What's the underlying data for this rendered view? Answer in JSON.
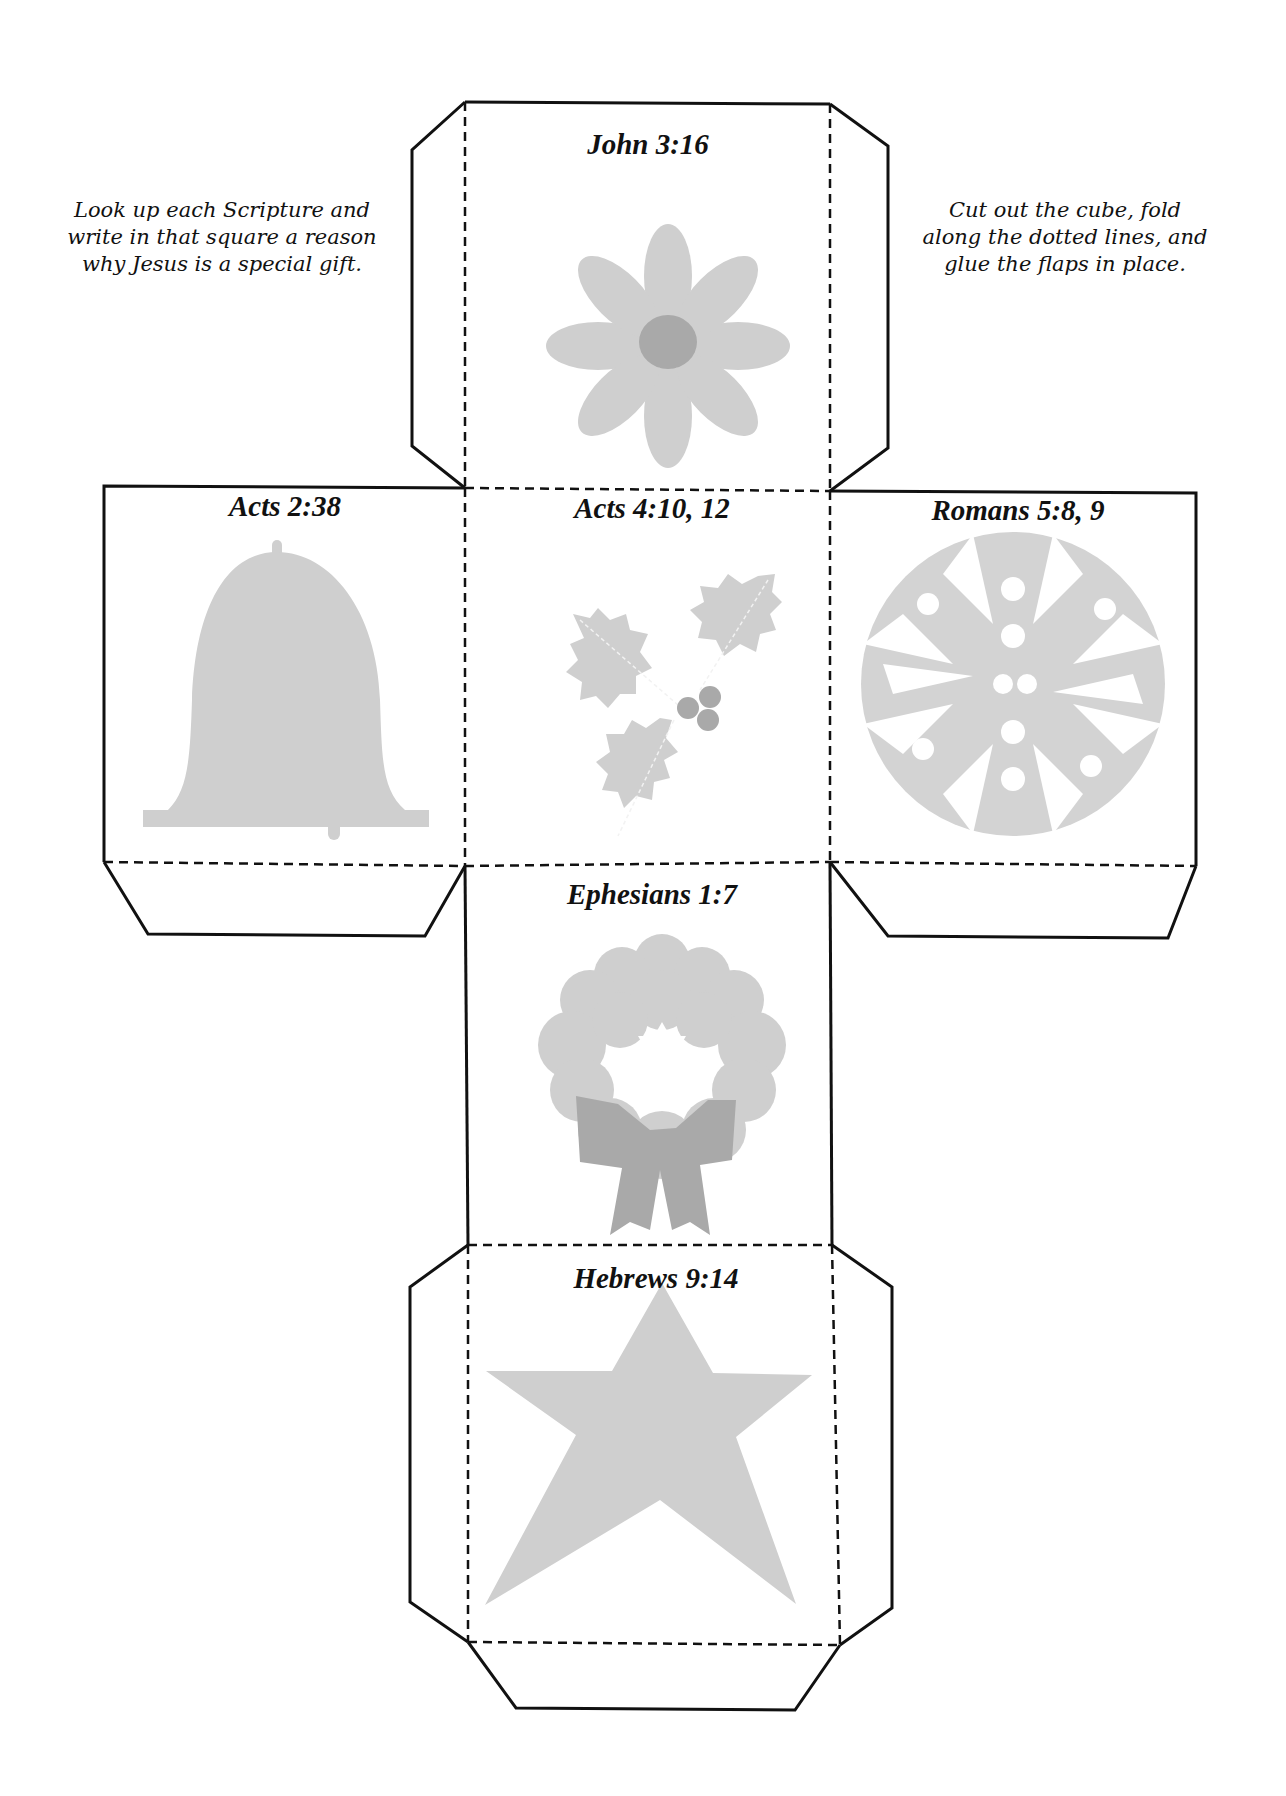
{
  "instructions": {
    "left": "Look up each Scripture and write in that square a reason why Jesus is a special gift.",
    "right": "Cut out the cube, fold along the dotted lines, and glue the flaps in place."
  },
  "faces": [
    {
      "id": "top",
      "title": "John 3:16",
      "icon": "flower-icon"
    },
    {
      "id": "left",
      "title": "Acts 2:38",
      "icon": "bell-icon"
    },
    {
      "id": "center",
      "title": "Acts 4:10, 12",
      "icon": "holly-icon"
    },
    {
      "id": "right",
      "title": "Romans 5:8, 9",
      "icon": "snowflake-icon"
    },
    {
      "id": "lower",
      "title": "Ephesians 1:7",
      "icon": "wreath-icon"
    },
    {
      "id": "bottom",
      "title": "Hebrews 9:14",
      "icon": "star-icon"
    }
  ],
  "colors": {
    "outline": "#111111",
    "shape_light": "#cfcfcf",
    "shape_dark": "#a9a9a9"
  }
}
